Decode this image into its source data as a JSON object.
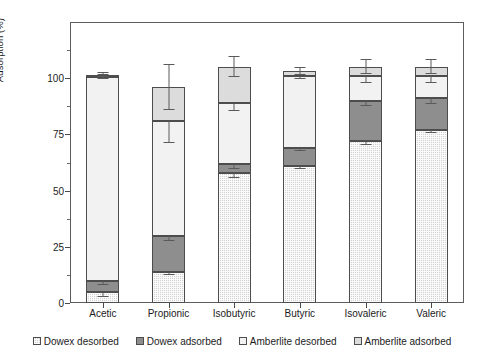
{
  "chart_data": {
    "type": "bar",
    "subtype": "stacked-column",
    "title": "",
    "xlabel": "",
    "ylabel": "Adsorption (%)",
    "ylim": [
      0,
      125
    ],
    "yticks": [
      0,
      25,
      50,
      75,
      100
    ],
    "ytick_labels": [
      "0",
      "25",
      "50",
      "75",
      "100"
    ],
    "yminor_ticks": [
      12.5,
      37.5,
      62.5,
      87.5,
      112.5
    ],
    "grid": false,
    "legend_position": "bottom",
    "categories": [
      "Acetic",
      "Propionic",
      "Isobutyric",
      "Butyric",
      "Isovaleric",
      "Valeric"
    ],
    "series": [
      {
        "name": "Dowex desorbed",
        "color": "#d2d2d2",
        "pattern": "fine-checker",
        "values": [
          5,
          14,
          58,
          61,
          72,
          77
        ],
        "errors": [
          2.5,
          1.5,
          2.5,
          1.5,
          1.5,
          1.5
        ]
      },
      {
        "name": "Dowex adsorbed",
        "color": "#8e8e8e",
        "pattern": "solid-gray",
        "values": [
          5,
          16,
          4,
          8,
          18,
          14
        ],
        "cumulative_tops": [
          10,
          30,
          62,
          69,
          90,
          91
        ],
        "errors": [
          2.0,
          2.5,
          2.5,
          1.5,
          2.5,
          2.5
        ]
      },
      {
        "name": "Amberlite desorbed",
        "color": "#f2f2f2",
        "pattern": "light",
        "values": [
          90.5,
          51,
          27,
          32,
          11,
          10
        ],
        "cumulative_tops": [
          100.5,
          81,
          89,
          101,
          101,
          101
        ],
        "errors": [
          1.0,
          10.0,
          3.5,
          1.5,
          3.0,
          3.0
        ]
      },
      {
        "name": "Amberlite adsorbed",
        "color": "#dcdcdc",
        "pattern": "light-checker",
        "values": [
          1,
          15,
          16,
          2,
          4,
          4
        ],
        "cumulative_tops": [
          101.5,
          96,
          105,
          103,
          105,
          105
        ],
        "errors": [
          1.0,
          10.0,
          4.5,
          1.5,
          3.0,
          3.0
        ]
      }
    ]
  },
  "legend": {
    "items": [
      {
        "label": "Dowex desorbed"
      },
      {
        "label": "Dowex adsorbed"
      },
      {
        "label": "Amberlite desorbed"
      },
      {
        "label": "Amberlite adsorbed"
      }
    ]
  }
}
